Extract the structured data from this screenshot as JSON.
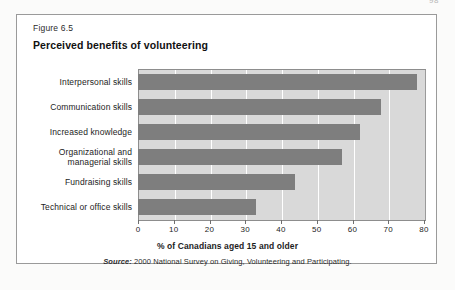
{
  "page": {
    "page_number": "98",
    "background_color": "#fbfbfa",
    "border_color": "#9a9a9a"
  },
  "figure": {
    "caption": "Figure 6.5",
    "title": "Perceived benefits of volunteering",
    "source_prefix": "Source:",
    "source_text": " 2000 National Survey on Giving, Volunteering and Participating."
  },
  "colors": {
    "bar": "#7e7e7e",
    "plot_background": "#d9d9d9",
    "gridline": "#ffffff",
    "axis": "#8d8d8d",
    "text": "#1d1d1d"
  },
  "chart_data": {
    "type": "bar",
    "orientation": "horizontal",
    "title": "Perceived benefits of volunteering",
    "xlabel": "% of Canadians aged 15 and older",
    "ylabel": "",
    "xlim": [
      0,
      80
    ],
    "xticks": [
      0,
      10,
      20,
      30,
      40,
      50,
      60,
      70,
      80
    ],
    "xtick_labels": [
      "0",
      "10",
      "20",
      "30",
      "40",
      "50",
      "60",
      "70",
      "80"
    ],
    "grid": true,
    "legend": "none",
    "categories": [
      "Interpersonal skills",
      "Communication skills",
      "Increased knowledge",
      "Organizational and managerial skills",
      "Fundraising skills",
      "Technical or office skills"
    ],
    "values": [
      78,
      68,
      62,
      57,
      44,
      33
    ],
    "series": [
      {
        "name": "% of Canadians aged 15 and older",
        "values": [
          78,
          68,
          62,
          57,
          44,
          33
        ]
      }
    ],
    "source": "Source: 2000 National Survey on Giving, Volunteering and Participating."
  }
}
